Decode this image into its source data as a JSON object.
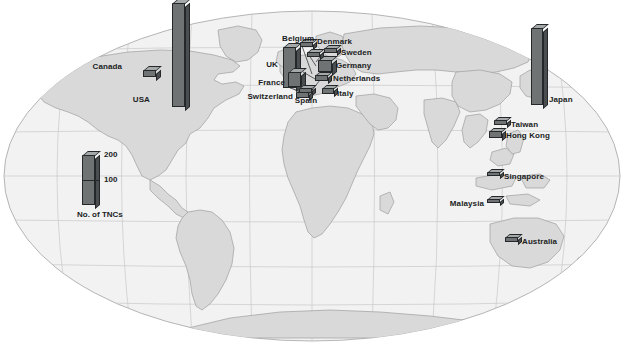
{
  "figure": {
    "projection": "robinson-world-map",
    "background_color": "#ffffff",
    "land_color": "#d9d9d9",
    "land_outline_color": "#9a9a9a",
    "graticule_color": "#c6c6c6",
    "bar_front_color": "#6f7374",
    "bar_side_color": "#4a4e50",
    "bar_top_color": "#a5a9aa",
    "bar_outline_color": "#24282a",
    "label_color": "#1b1d1e"
  },
  "legend": {
    "caption": "No. of TNCs",
    "ticks": [
      {
        "label": "200",
        "value": 200
      },
      {
        "label": "100",
        "value": 100
      }
    ]
  },
  "chart_data": {
    "type": "bar",
    "title": "",
    "xlabel": "",
    "ylabel": "No. of TNCs",
    "ylim": [
      0,
      210
    ],
    "categories": [
      "USA",
      "Japan",
      "UK",
      "France",
      "Germany",
      "Netherlands",
      "Switzerland",
      "Canada",
      "Italy",
      "Sweden",
      "Belgium",
      "Spain",
      "Denmark",
      "Hong Kong",
      "Taiwan",
      "Australia",
      "Singapore",
      "Malaysia"
    ],
    "values": [
      205,
      190,
      80,
      36,
      30,
      17,
      16,
      15,
      14,
      12,
      11,
      10,
      9,
      14,
      9,
      8,
      7,
      7
    ]
  },
  "markers": [
    {
      "name": "usa",
      "label": "USA",
      "value": 205,
      "bar": {
        "x": 172,
        "y": 3,
        "w": 13,
        "h": 104,
        "depth": 5
      },
      "label_pos": {
        "x": 150,
        "y": 95,
        "align": "right"
      },
      "leader": null
    },
    {
      "name": "canada",
      "label": "Canada",
      "value": 15,
      "bar": {
        "x": 143,
        "y": 70,
        "w": 13,
        "h": 7,
        "depth": 5
      },
      "label_pos": {
        "x": 122,
        "y": 62,
        "align": "right"
      },
      "leader": null
    },
    {
      "name": "japan",
      "label": "Japan",
      "value": 190,
      "bar": {
        "x": 531,
        "y": 28,
        "w": 12,
        "h": 77,
        "depth": 5
      },
      "label_pos": {
        "x": 549,
        "y": 95,
        "align": "left"
      },
      "leader": null
    },
    {
      "name": "uk",
      "label": "UK",
      "value": 80,
      "bar": {
        "x": 283,
        "y": 47,
        "w": 13,
        "h": 41,
        "depth": 5
      },
      "label_pos": {
        "x": 278,
        "y": 60,
        "align": "right"
      },
      "leader": null
    },
    {
      "name": "france",
      "label": "France",
      "value": 36,
      "bar": {
        "x": 288,
        "y": 72,
        "w": 13,
        "h": 15,
        "depth": 5
      },
      "label_pos": {
        "x": 285,
        "y": 78,
        "align": "right"
      },
      "leader": null
    },
    {
      "name": "germany",
      "label": "Germany",
      "value": 30,
      "bar": {
        "x": 318,
        "y": 60,
        "w": 14,
        "h": 12,
        "depth": 5
      },
      "label_pos": {
        "x": 336,
        "y": 61,
        "align": "left"
      },
      "leader": null
    },
    {
      "name": "netherlands",
      "label": "Netherlands",
      "value": 17,
      "bar": {
        "x": 315,
        "y": 75,
        "w": 13,
        "h": 6,
        "depth": 4
      },
      "label_pos": {
        "x": 333,
        "y": 74,
        "align": "left"
      },
      "leader": {
        "x1": 315,
        "y1": 79,
        "x2": 303,
        "y2": 72
      }
    },
    {
      "name": "switzerland",
      "label": "Switzerland",
      "value": 16,
      "bar": {
        "x": 296,
        "y": 92,
        "w": 13,
        "h": 6,
        "depth": 4
      },
      "label_pos": {
        "x": 293,
        "y": 92,
        "align": "right"
      },
      "leader": {
        "x1": 309,
        "y1": 94,
        "x2": 320,
        "y2": 80
      }
    },
    {
      "name": "italy",
      "label": "Italy",
      "value": 14,
      "bar": {
        "x": 322,
        "y": 88,
        "w": 12,
        "h": 6,
        "depth": 4
      },
      "label_pos": {
        "x": 337,
        "y": 89,
        "align": "left"
      },
      "leader": null
    },
    {
      "name": "sweden",
      "label": "Sweden",
      "value": 12,
      "bar": {
        "x": 324,
        "y": 48,
        "w": 13,
        "h": 5,
        "depth": 4
      },
      "label_pos": {
        "x": 341,
        "y": 48,
        "align": "left"
      },
      "leader": {
        "x1": 324,
        "y1": 52,
        "x2": 316,
        "y2": 62
      }
    },
    {
      "name": "belgium",
      "label": "Belgium",
      "value": 11,
      "bar": {
        "x": 300,
        "y": 42,
        "w": 13,
        "h": 5,
        "depth": 4
      },
      "label_pos": {
        "x": 282,
        "y": 34,
        "align": "left"
      },
      "leader": {
        "x1": 302,
        "y1": 46,
        "x2": 312,
        "y2": 74
      }
    },
    {
      "name": "spain",
      "label": "Spain",
      "value": 10,
      "bar": {
        "x": 299,
        "y": 88,
        "w": 13,
        "h": 5,
        "depth": 4
      },
      "label_pos": {
        "x": 306,
        "y": 96,
        "align": "center"
      },
      "leader": {
        "x1": 299,
        "y1": 91,
        "x2": 290,
        "y2": 88
      }
    },
    {
      "name": "denmark",
      "label": "Denmark",
      "value": 9,
      "bar": {
        "x": 307,
        "y": 52,
        "w": 13,
        "h": 5,
        "depth": 4
      },
      "label_pos": {
        "x": 317,
        "y": 37,
        "align": "left"
      },
      "leader": {
        "x1": 309,
        "y1": 55,
        "x2": 316,
        "y2": 66
      }
    },
    {
      "name": "taiwan",
      "label": "Taiwan",
      "value": 9,
      "bar": {
        "x": 494,
        "y": 120,
        "w": 13,
        "h": 5,
        "depth": 4
      },
      "label_pos": {
        "x": 511,
        "y": 120,
        "align": "left"
      },
      "leader": null
    },
    {
      "name": "hong-kong",
      "label": "Hong Kong",
      "value": 14,
      "bar": {
        "x": 489,
        "y": 131,
        "w": 13,
        "h": 7,
        "depth": 4
      },
      "label_pos": {
        "x": 506,
        "y": 131,
        "align": "left"
      },
      "leader": null
    },
    {
      "name": "singapore",
      "label": "Singapore",
      "value": 7,
      "bar": {
        "x": 487,
        "y": 172,
        "w": 13,
        "h": 4,
        "depth": 4
      },
      "label_pos": {
        "x": 504,
        "y": 172,
        "align": "left"
      },
      "leader": null
    },
    {
      "name": "malaysia",
      "label": "Malaysia",
      "value": 7,
      "bar": {
        "x": 487,
        "y": 199,
        "w": 13,
        "h": 4,
        "depth": 4
      },
      "label_pos": {
        "x": 484,
        "y": 199,
        "align": "right"
      },
      "leader": null
    },
    {
      "name": "australia",
      "label": "Australia",
      "value": 8,
      "bar": {
        "x": 505,
        "y": 237,
        "w": 13,
        "h": 5,
        "depth": 4
      },
      "label_pos": {
        "x": 522,
        "y": 237,
        "align": "left"
      },
      "leader": null
    }
  ]
}
